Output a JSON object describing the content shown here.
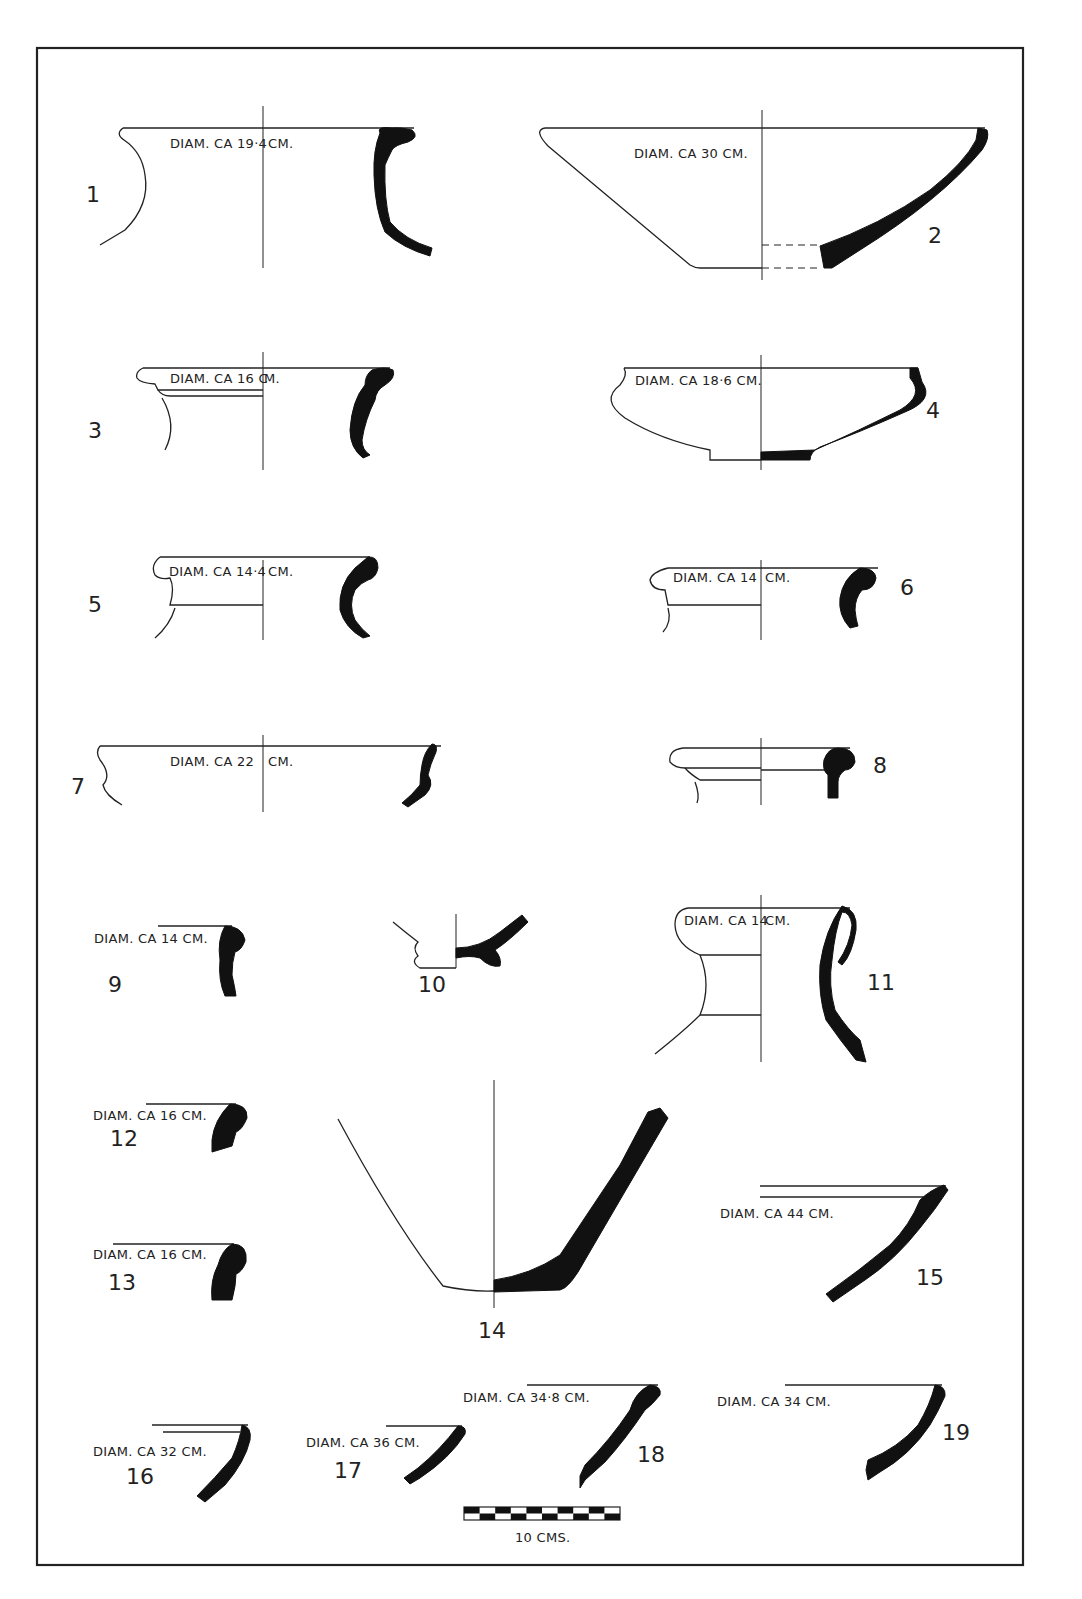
{
  "plate": {
    "frame_color": "#222222",
    "section_fill": "#111111",
    "background": "#ffffff"
  },
  "sherds": [
    {
      "number": "1",
      "label": "DIAM. CA 19·4 CM."
    },
    {
      "number": "2",
      "label": "DIAM. CA 30 CM."
    },
    {
      "number": "3",
      "label": "DIAM. CA 16 CM."
    },
    {
      "number": "4",
      "label": "DIAM. CA 18·6 CM."
    },
    {
      "number": "5",
      "label": "DIAM. CA 14·4 CM."
    },
    {
      "number": "6",
      "label": "DIAM. CA 14 CM."
    },
    {
      "number": "7",
      "label": "DIAM. CA 22 CM."
    },
    {
      "number": "8",
      "label": ""
    },
    {
      "number": "9",
      "label": "DIAM. CA 14 CM."
    },
    {
      "number": "10",
      "label": ""
    },
    {
      "number": "11",
      "label": "DIAM. CA 14 CM."
    },
    {
      "number": "12",
      "label": "DIAM. CA 16 CM."
    },
    {
      "number": "13",
      "label": "DIAM. CA 16 CM."
    },
    {
      "number": "14",
      "label": ""
    },
    {
      "number": "15",
      "label": "DIAM. CA 44 CM."
    },
    {
      "number": "16",
      "label": "DIAM. CA 32 CM."
    },
    {
      "number": "17",
      "label": "DIAM. CA 36 CM."
    },
    {
      "number": "18",
      "label": "DIAM. CA 34·8 CM."
    },
    {
      "number": "19",
      "label": "DIAM. CA 34 CM."
    }
  ],
  "labels_display": {
    "l1a": "DIAM. CA 19·4",
    "l1b": "CM.",
    "l2": "DIAM. CA 30 CM.",
    "l3a": "DIAM. CA 16 C",
    "l3b": "M.",
    "l4": "DIAM. CA 18·6 CM.",
    "l5a": "DIAM. CA 14·4",
    "l5b": "CM.",
    "l6a": "DIAM. CA 14",
    "l6b": "CM.",
    "l7a": "DIAM. CA 22",
    "l7b": "CM.",
    "l9": "DIAM. CA 14 CM.",
    "l11a": "DIAM. CA 14",
    "l11b": "CM.",
    "l12": "DIAM. CA 16 CM.",
    "l13": "DIAM. CA 16 CM.",
    "l15": "DIAM. CA 44 CM.",
    "l16": "DIAM. CA 32 CM.",
    "l17": "DIAM. CA 36 CM.",
    "l18": "DIAM. CA 34·8 CM.",
    "l19": "DIAM. CA 34 CM."
  },
  "scale_bar": {
    "label": "10 CMS.",
    "segments": 10
  }
}
